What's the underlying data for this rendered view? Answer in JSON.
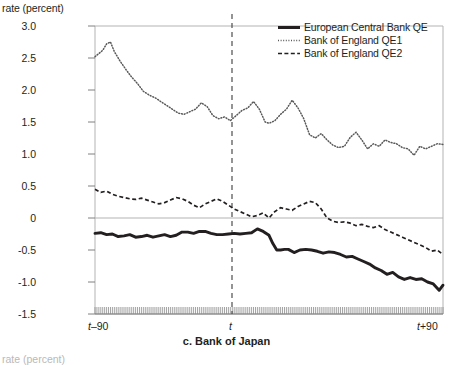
{
  "panel": {
    "caption": "c. Bank of Japan",
    "y_axis_title": "rate (percent)",
    "next_panel_label": "rate (percent)"
  },
  "legend": {
    "position": "top-right",
    "items": [
      {
        "label": "European Central Bank QE",
        "style": "solid-thick",
        "color": "#231f20",
        "swatch": "solid-line-swatch"
      },
      {
        "label": "Bank of England QE1",
        "style": "fine-dotted",
        "color": "#4d4d4d",
        "swatch": "dotted-line-swatch"
      },
      {
        "label": "Bank of England QE2",
        "style": "dashed",
        "color": "#231f20",
        "swatch": "dashed-line-swatch"
      }
    ]
  },
  "chart_data": {
    "type": "line",
    "title": "c. Bank of Japan",
    "xlabel": "",
    "ylabel": "rate (percent)",
    "ylim": [
      -1.5,
      3.0
    ],
    "yticks": [
      3.0,
      2.5,
      2.0,
      1.5,
      1.0,
      0.5,
      0,
      -0.5,
      -1.0,
      -1.5
    ],
    "ytick_labels": [
      "3.0",
      "2.5",
      "2.0",
      "1.5",
      "1.0",
      "0.5",
      "0",
      "-0.5",
      "-1.0",
      "-1.5"
    ],
    "xlim": [
      -90,
      90
    ],
    "xticks": [
      -90,
      0,
      90
    ],
    "xtick_labels": [
      "t-90",
      "t",
      "t+90"
    ],
    "grid": "horizontal-at-0-and-top",
    "event_marker": {
      "x": 0,
      "label": "t",
      "style": "vertical-dashed"
    },
    "minor_ticks": "dense-daily-ticks-on-x-axis",
    "series": [
      {
        "name": "European Central Bank QE",
        "style": "solid-thick",
        "color": "#231f20",
        "x": [
          -90,
          -87,
          -84,
          -81,
          -78,
          -75,
          -72,
          -69,
          -66,
          -63,
          -60,
          -57,
          -54,
          -51,
          -48,
          -45,
          -42,
          -39,
          -36,
          -33,
          -30,
          -27,
          -24,
          -21,
          -18,
          -15,
          -12,
          -9,
          -6,
          -3,
          0,
          2,
          4,
          6,
          8,
          10,
          13,
          16,
          19,
          22,
          25,
          28,
          31,
          34,
          37,
          40,
          43,
          46,
          49,
          52,
          55,
          58,
          61,
          64,
          67,
          70,
          73,
          76,
          79,
          82,
          85,
          88,
          90
        ],
        "values": [
          -0.24,
          -0.23,
          -0.26,
          -0.25,
          -0.29,
          -0.28,
          -0.26,
          -0.3,
          -0.29,
          -0.27,
          -0.3,
          -0.28,
          -0.26,
          -0.29,
          -0.27,
          -0.22,
          -0.22,
          -0.24,
          -0.21,
          -0.21,
          -0.24,
          -0.26,
          -0.26,
          -0.25,
          -0.24,
          -0.25,
          -0.24,
          -0.23,
          -0.17,
          -0.21,
          -0.27,
          -0.4,
          -0.5,
          -0.5,
          -0.49,
          -0.49,
          -0.54,
          -0.5,
          -0.49,
          -0.5,
          -0.52,
          -0.55,
          -0.53,
          -0.54,
          -0.57,
          -0.61,
          -0.6,
          -0.64,
          -0.68,
          -0.72,
          -0.78,
          -0.82,
          -0.88,
          -0.85,
          -0.92,
          -0.96,
          -0.93,
          -0.96,
          -0.95,
          -1.0,
          -1.03,
          -1.13,
          -1.05
        ]
      },
      {
        "name": "Bank of England QE1",
        "style": "fine-dotted",
        "color": "#595959",
        "x": [
          -90,
          -88,
          -86,
          -84,
          -82,
          -80,
          -77,
          -74,
          -71,
          -68,
          -65,
          -62,
          -59,
          -56,
          -53,
          -50,
          -47,
          -44,
          -41,
          -38,
          -35,
          -32,
          -29,
          -26,
          -23,
          -20,
          -17,
          -14,
          -11,
          -8,
          -5,
          -2,
          0,
          3,
          6,
          9,
          12,
          15,
          18,
          21,
          24,
          27,
          30,
          33,
          36,
          39,
          42,
          45,
          48,
          51,
          54,
          57,
          60,
          63,
          66,
          69,
          72,
          75,
          78,
          81,
          84,
          87,
          90
        ],
        "values": [
          2.52,
          2.57,
          2.62,
          2.72,
          2.75,
          2.6,
          2.45,
          2.32,
          2.2,
          2.1,
          1.98,
          1.92,
          1.88,
          1.82,
          1.76,
          1.7,
          1.64,
          1.62,
          1.66,
          1.7,
          1.8,
          1.74,
          1.6,
          1.55,
          1.58,
          1.52,
          1.6,
          1.68,
          1.72,
          1.82,
          1.7,
          1.5,
          1.48,
          1.52,
          1.62,
          1.7,
          1.84,
          1.72,
          1.55,
          1.3,
          1.25,
          1.32,
          1.22,
          1.14,
          1.1,
          1.12,
          1.26,
          1.34,
          1.22,
          1.08,
          1.16,
          1.12,
          1.22,
          1.18,
          1.16,
          1.1,
          1.08,
          0.98,
          1.12,
          1.08,
          1.12,
          1.16,
          1.15
        ]
      },
      {
        "name": "Bank of England QE2",
        "style": "dashed",
        "color": "#231f20",
        "x": [
          -90,
          -87,
          -84,
          -81,
          -78,
          -75,
          -72,
          -69,
          -66,
          -63,
          -60,
          -57,
          -54,
          -51,
          -48,
          -45,
          -42,
          -39,
          -36,
          -33,
          -30,
          -27,
          -24,
          -21,
          -18,
          -15,
          -12,
          -9,
          -6,
          -3,
          0,
          3,
          6,
          9,
          12,
          15,
          18,
          21,
          24,
          27,
          30,
          33,
          36,
          39,
          42,
          45,
          48,
          51,
          54,
          57,
          60,
          63,
          66,
          69,
          72,
          75,
          78,
          81,
          84,
          87,
          90
        ],
        "values": [
          0.45,
          0.4,
          0.42,
          0.37,
          0.34,
          0.32,
          0.3,
          0.29,
          0.31,
          0.28,
          0.25,
          0.22,
          0.24,
          0.28,
          0.32,
          0.3,
          0.26,
          0.2,
          0.16,
          0.22,
          0.26,
          0.3,
          0.26,
          0.2,
          0.14,
          0.1,
          0.06,
          0.02,
          0.04,
          0.08,
          0.0,
          0.1,
          0.16,
          0.14,
          0.12,
          0.18,
          0.22,
          0.26,
          0.24,
          0.14,
          0.0,
          -0.05,
          -0.07,
          -0.06,
          -0.08,
          -0.12,
          -0.1,
          -0.13,
          -0.15,
          -0.12,
          -0.18,
          -0.22,
          -0.26,
          -0.3,
          -0.34,
          -0.38,
          -0.42,
          -0.46,
          -0.52,
          -0.5,
          -0.57
        ]
      }
    ]
  }
}
